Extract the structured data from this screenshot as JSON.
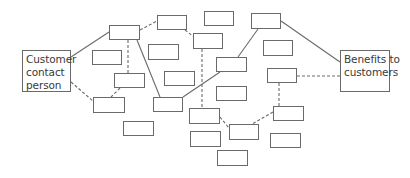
{
  "diagram": {
    "left_node": {
      "lines": [
        "Customer",
        "contact",
        "person"
      ],
      "box": [
        22,
        50,
        49,
        42
      ]
    },
    "right_node": {
      "lines": [
        "Benefits to",
        "customers"
      ],
      "box": [
        340,
        50,
        50,
        42
      ]
    },
    "colors": {
      "stroke": "#6a6a6a",
      "text": "#3a3a3a",
      "background": "#ffffff"
    },
    "empty_boxes": [
      {
        "id": "A",
        "x": 109,
        "y": 25,
        "w": 31,
        "h": 15
      },
      {
        "id": "B",
        "x": 157,
        "y": 15,
        "w": 30,
        "h": 15
      },
      {
        "id": "C",
        "x": 92,
        "y": 50,
        "w": 30,
        "h": 15
      },
      {
        "id": "D",
        "x": 148,
        "y": 44,
        "w": 31,
        "h": 16
      },
      {
        "id": "E",
        "x": 114,
        "y": 73,
        "w": 31,
        "h": 15
      },
      {
        "id": "F",
        "x": 164,
        "y": 71,
        "w": 31,
        "h": 15
      },
      {
        "id": "G",
        "x": 93,
        "y": 97,
        "w": 32,
        "h": 16
      },
      {
        "id": "H",
        "x": 153,
        "y": 97,
        "w": 30,
        "h": 15
      },
      {
        "id": "I",
        "x": 123,
        "y": 121,
        "w": 31,
        "h": 15
      },
      {
        "id": "K",
        "x": 204,
        "y": 11,
        "w": 30,
        "h": 15
      },
      {
        "id": "L",
        "x": 251,
        "y": 13,
        "w": 30,
        "h": 16
      },
      {
        "id": "M",
        "x": 193,
        "y": 33,
        "w": 30,
        "h": 16
      },
      {
        "id": "N",
        "x": 216,
        "y": 57,
        "w": 31,
        "h": 15
      },
      {
        "id": "O",
        "x": 263,
        "y": 40,
        "w": 30,
        "h": 16
      },
      {
        "id": "P",
        "x": 267,
        "y": 68,
        "w": 30,
        "h": 15
      },
      {
        "id": "W",
        "x": 216,
        "y": 86,
        "w": 31,
        "h": 15
      },
      {
        "id": "Q",
        "x": 189,
        "y": 108,
        "w": 31,
        "h": 16
      },
      {
        "id": "R",
        "x": 190,
        "y": 131,
        "w": 31,
        "h": 16
      },
      {
        "id": "S",
        "x": 229,
        "y": 124,
        "w": 30,
        "h": 16
      },
      {
        "id": "T",
        "x": 217,
        "y": 150,
        "w": 31,
        "h": 16
      },
      {
        "id": "U",
        "x": 273,
        "y": 106,
        "w": 31,
        "h": 15
      },
      {
        "id": "V",
        "x": 270,
        "y": 133,
        "w": 31,
        "h": 15
      }
    ],
    "connectors": [
      {
        "from": "customer",
        "to": "A",
        "style": "solid",
        "points": [
          71,
          57,
          109,
          32
        ]
      },
      {
        "from": "customer",
        "to": "G",
        "style": "dashed",
        "points": [
          71,
          82,
          93,
          101
        ]
      },
      {
        "from": "A",
        "to": "B",
        "style": "dashed",
        "points": [
          140,
          30,
          157,
          21
        ]
      },
      {
        "from": "A",
        "to": "E",
        "style": "dashed",
        "points": [
          128,
          40,
          128,
          73
        ]
      },
      {
        "from": "A",
        "to": "H",
        "style": "solid",
        "points": [
          137,
          40,
          160,
          97
        ]
      },
      {
        "from": "B",
        "to": "M",
        "style": "dashed",
        "points": [
          185,
          30,
          194,
          37
        ]
      },
      {
        "from": "E",
        "to": "G",
        "style": "dashed",
        "points": [
          120,
          88,
          111,
          97
        ]
      },
      {
        "from": "H",
        "to": "N",
        "style": "solid",
        "points": [
          183,
          97,
          220,
          72
        ]
      },
      {
        "from": "M",
        "to": "Q",
        "style": "dashed",
        "points": [
          202,
          49,
          202,
          108
        ]
      },
      {
        "from": "L",
        "to": "N",
        "style": "solid",
        "points": [
          258,
          29,
          238,
          57
        ]
      },
      {
        "from": "L",
        "to": "benefits",
        "style": "solid",
        "points": [
          281,
          21,
          340,
          62
        ]
      },
      {
        "from": "P",
        "to": "benefits",
        "style": "dashed",
        "points": [
          297,
          76,
          340,
          76
        ]
      },
      {
        "from": "P",
        "to": "U",
        "style": "dashed",
        "points": [
          279,
          83,
          279,
          106
        ]
      },
      {
        "from": "Q",
        "to": "S",
        "style": "dashed",
        "points": [
          220,
          117,
          229,
          128
        ]
      },
      {
        "from": "U",
        "to": "S",
        "style": "dashed",
        "points": [
          273,
          112,
          252,
          124
        ]
      }
    ]
  }
}
